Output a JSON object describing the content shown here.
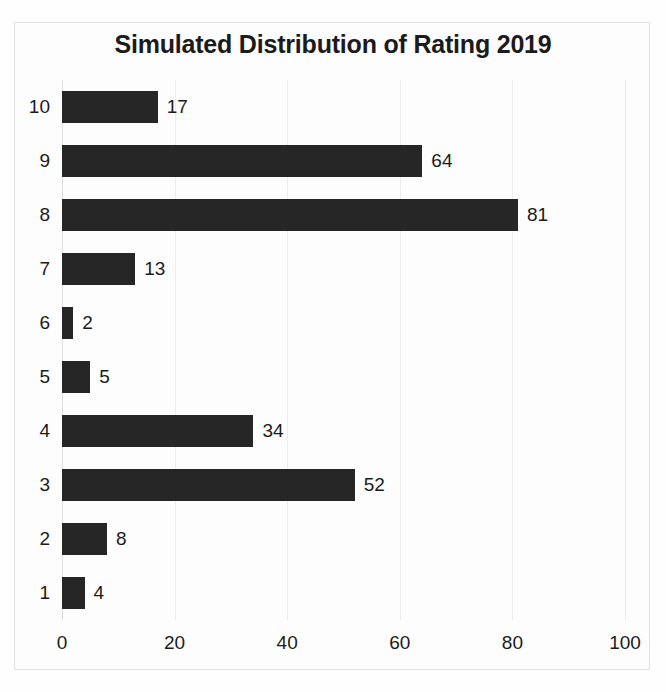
{
  "chart_data": {
    "type": "bar",
    "orientation": "horizontal",
    "title": "Simulated Distribution of Rating 2019",
    "xlabel": "",
    "ylabel": "",
    "categories": [
      "1",
      "2",
      "3",
      "4",
      "5",
      "6",
      "7",
      "8",
      "9",
      "10"
    ],
    "values": [
      4,
      8,
      52,
      34,
      5,
      2,
      13,
      81,
      64,
      17
    ],
    "bars": [
      {
        "category": "10",
        "value": 17,
        "label": "17"
      },
      {
        "category": "9",
        "value": 64,
        "label": "64"
      },
      {
        "category": "8",
        "value": 81,
        "label": "81"
      },
      {
        "category": "7",
        "value": 13,
        "label": "13"
      },
      {
        "category": "6",
        "value": 2,
        "label": "2"
      },
      {
        "category": "5",
        "value": 5,
        "label": "5"
      },
      {
        "category": "4",
        "value": 34,
        "label": "34"
      },
      {
        "category": "3",
        "value": 52,
        "label": "52"
      },
      {
        "category": "2",
        "value": 8,
        "label": "8"
      },
      {
        "category": "1",
        "value": 4,
        "label": "4"
      }
    ],
    "xlim": [
      0,
      100
    ],
    "x_ticks": [
      0,
      20,
      40,
      60,
      80,
      100
    ],
    "x_tick_labels": [
      "0",
      "20",
      "40",
      "60",
      "80",
      "100"
    ],
    "grid": true,
    "legend": null,
    "bar_color": "#262626",
    "grid_color": "#ededed",
    "background_color": "#fdfdfd",
    "text_color": "#1b1b1b"
  }
}
